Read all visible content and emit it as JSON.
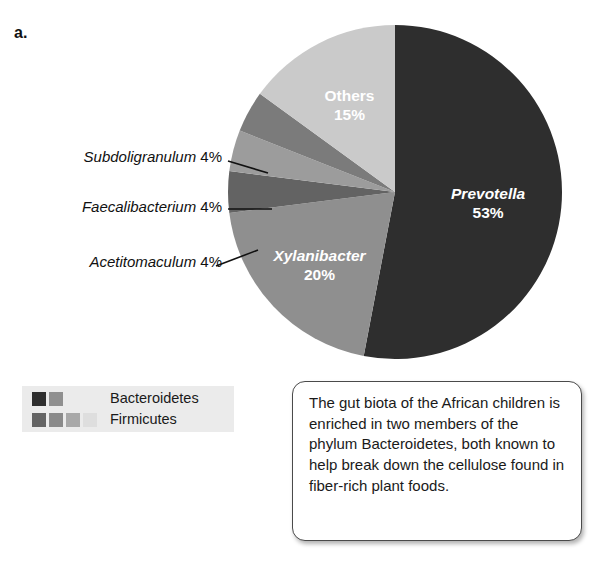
{
  "figure": {
    "panel_letter": "a."
  },
  "chart_data": {
    "type": "pie",
    "title": "",
    "categories": [
      "Prevotella",
      "Xylanibacter",
      "Acetitomaculum",
      "Faecalibacterium",
      "Subdoligranulum",
      "Others"
    ],
    "values": [
      53,
      20,
      4,
      4,
      4,
      15
    ],
    "value_unit": "%",
    "start_angle_deg": 0,
    "direction": "clockwise",
    "legend_position": "below-left",
    "grid": false,
    "slices": [
      {
        "name": "Prevotella",
        "value": 53,
        "label": "Prevotella",
        "value_label": "53%",
        "color": "#2e2e2e",
        "label_placement": "inside",
        "label_color": "#ffffff",
        "italic": true,
        "phylum": "Bacteroidetes"
      },
      {
        "name": "Xylanibacter",
        "value": 20,
        "label": "Xylanibacter",
        "value_label": "20%",
        "color": "#8f8f8f",
        "label_placement": "inside",
        "label_color": "#ffffff",
        "italic": true,
        "phylum": "Bacteroidetes"
      },
      {
        "name": "Acetitomaculum",
        "value": 4,
        "label": "Acetitomaculum",
        "value_label": "4%",
        "color": "#636363",
        "label_placement": "callout",
        "label_color": "#111111",
        "italic": true,
        "phylum": "Firmicutes"
      },
      {
        "name": "Faecalibacterium",
        "value": 4,
        "label": "Faecalibacterium",
        "value_label": "4%",
        "color": "#9c9c9c",
        "label_placement": "callout",
        "label_color": "#111111",
        "italic": true,
        "phylum": "Firmicutes"
      },
      {
        "name": "Subdoligranulum",
        "value": 4,
        "label": "Subdoligranulum",
        "value_label": "4%",
        "color": "#7b7b7b",
        "label_placement": "callout",
        "label_color": "#111111",
        "italic": true,
        "phylum": "Firmicutes"
      },
      {
        "name": "Others",
        "value": 15,
        "label": "Others",
        "value_label": "15%",
        "color": "#cacaca",
        "label_placement": "inside",
        "label_color": "#ffffff",
        "italic": false,
        "phylum": "Firmicutes"
      }
    ]
  },
  "callouts": [
    {
      "name": "Subdoligranulum",
      "value_label": "4%"
    },
    {
      "name": "Faecalibacterium",
      "value_label": "4%"
    },
    {
      "name": "Acetitomaculum",
      "value_label": "4%"
    }
  ],
  "legend": {
    "background": "#ebebeb",
    "rows": [
      {
        "label": "Bacteroidetes",
        "swatches": [
          "#2e2e2e",
          "#8f8f8f"
        ]
      },
      {
        "label": "Firmicutes",
        "swatches": [
          "#636363",
          "#8a8a8a",
          "#a8a8a8",
          "#dedede"
        ]
      }
    ]
  },
  "caption": {
    "text": "The gut biota of the African children is enriched in two members of the phylum Bacteroidetes, both known to help break down the cellulose found in fiber-rich plant foods."
  }
}
